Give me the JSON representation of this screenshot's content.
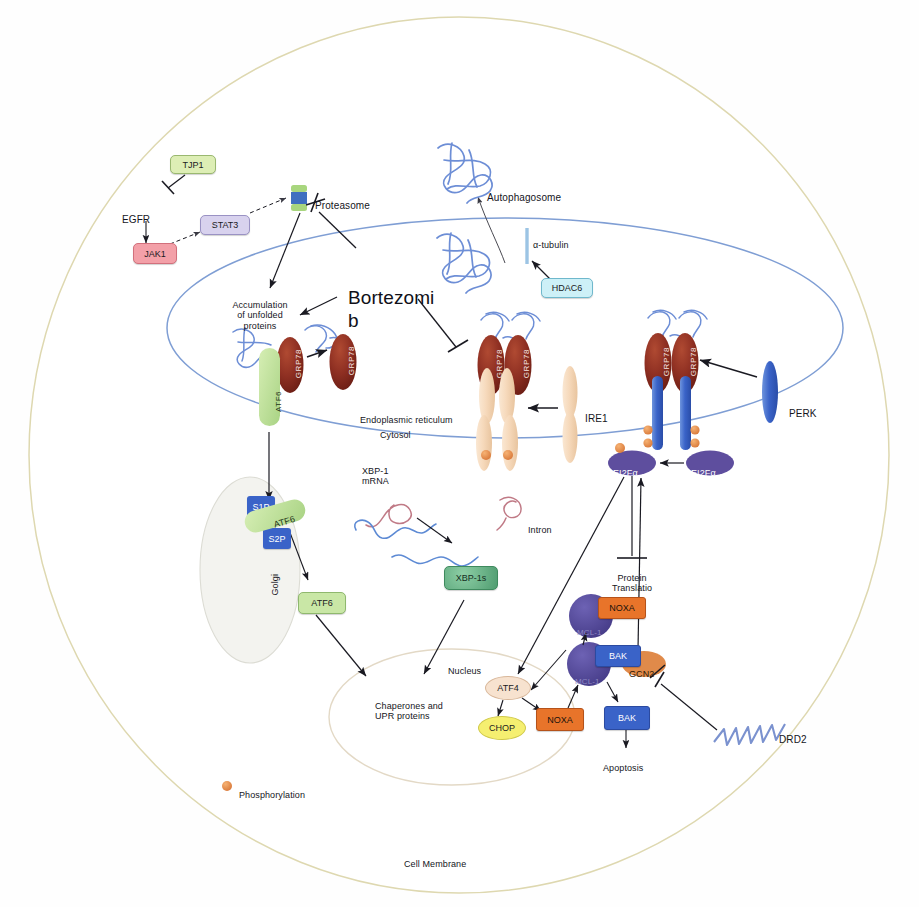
{
  "figure": {
    "compartments": {
      "cell_membrane": "Cell Membrane",
      "endoplasmic_reticulum": "Endoplasmic reticulum",
      "cytosol": "Cytosol",
      "golgi": "Golgi",
      "nucleus": "Nucleus"
    },
    "drug": {
      "label": "Bortezomi\nb",
      "full": "Bortezomib"
    },
    "legend": {
      "marker": "phosphorylation-dot",
      "label": "Phosphorylation",
      "color": "#e8944a"
    }
  },
  "nodes": {
    "tjp1": {
      "label": "TJP1",
      "fill": "#ddeeb5",
      "stroke": "#9ab870",
      "text": "#1a1a22"
    },
    "egfr": {
      "label": "EGFR",
      "fill": "none",
      "stroke": "none",
      "text": "#15151c"
    },
    "stat3": {
      "label": "STAT3",
      "fill": "#d8d2ee",
      "stroke": "#9a92c4",
      "text": "#1a1a22"
    },
    "jak1": {
      "label": "JAK1",
      "fill": "#f3a0a8",
      "stroke": "#d2707c",
      "text": "#1a1a22"
    },
    "proteasome": {
      "label": "Proteasome",
      "cap": "#b8dd86",
      "body": "#3f6fc0"
    },
    "accumulation": {
      "label": "Accumulation\nof unfolded\nproteins"
    },
    "autophagosome": {
      "label": "Autophagosome"
    },
    "tubulin": {
      "label": "α-tubulin",
      "color": "#9cc4e4"
    },
    "hdac6": {
      "label": "HDAC6",
      "fill": "#cdf0f7",
      "stroke": "#6fb8cc",
      "text": "#1a1a22"
    },
    "grp78": {
      "label": "GRP78",
      "fill": "#8e2f22"
    },
    "atf6_er": {
      "label": "ATF6",
      "fill": "#bfe39a"
    },
    "atf6_golgi": {
      "label": "ATF6",
      "fill": "#bfe39a"
    },
    "atf6_free": {
      "label": "ATF6",
      "fill": "#c9e7a6",
      "stroke": "#8fb86e"
    },
    "s1p": {
      "label": "S1P",
      "fill": "#3a63c8",
      "text": "#ffffff"
    },
    "s2p": {
      "label": "S2P",
      "fill": "#3a63c8",
      "text": "#ffffff"
    },
    "ire1": {
      "label": "IRE1",
      "fill": "#f6dcc0"
    },
    "perk": {
      "label": "PERK",
      "fill": "#3a63c8"
    },
    "xbp1_mrna": {
      "label": "XBP-1\nmRNA"
    },
    "intron": {
      "label": "Intron"
    },
    "xbp1s": {
      "label": "XBP-1s",
      "fill": "#6fbb8a",
      "stroke": "#3f8a5e",
      "text": "#17301f"
    },
    "chaperones": {
      "label": "Chaperones and\nUPR proteins"
    },
    "eif2a_p": {
      "label": "EI2Fα",
      "fill": "#5e4e9e",
      "text": "#ffffff"
    },
    "eif2a": {
      "label": "EI2Fα",
      "fill": "#5e4e9e",
      "text": "#ffffff"
    },
    "protein_translation": {
      "label": "Protein\nTranslatio\nn",
      "full": "Protein Translation"
    },
    "atf4": {
      "label": "ATF4",
      "fill": "#f7e2cf",
      "stroke": "#d8b79a",
      "text": "#1a1a22"
    },
    "chop": {
      "label": "CHOP",
      "fill": "#f5ef70",
      "stroke": "#cfc84a",
      "text": "#1a1a22"
    },
    "noxa_nuc": {
      "label": "NOXA",
      "fill": "#e8742a",
      "stroke": "#b5521a",
      "text": "#17120c"
    },
    "noxa_bound": {
      "label": "NOXA",
      "fill": "#e8742a",
      "stroke": "#b5521a",
      "text": "#17120c"
    },
    "mcl1_a": {
      "label": "MCL-1",
      "fill": "#544a9a"
    },
    "mcl1_b": {
      "label": "MCL-1",
      "fill": "#544a9a"
    },
    "bak_bound": {
      "label": "BAK",
      "fill": "#3a63c8",
      "text": "#ffffff"
    },
    "bak_free": {
      "label": "BAK",
      "fill": "#3a63c8",
      "text": "#ffffff"
    },
    "apoptosis": {
      "label": "Apoptosis"
    },
    "gcn2": {
      "label": "GCN2",
      "fill": "#e08a4a",
      "text": "#2a1606"
    },
    "drd2": {
      "label": "DRD2",
      "color": "#6f86c8"
    }
  },
  "edges": [
    {
      "from": "tjp1",
      "to": "egfr",
      "type": "inhibit"
    },
    {
      "from": "egfr",
      "to": "jak1",
      "type": "activate"
    },
    {
      "from": "jak1",
      "to": "stat3",
      "type": "activate-dashed"
    },
    {
      "from": "stat3",
      "to": "proteasome",
      "type": "activate-dashed"
    },
    {
      "from": "proteasome",
      "to": "accumulation",
      "type": "activate"
    },
    {
      "from": "bortezomib",
      "to": "proteasome",
      "type": "inhibit"
    },
    {
      "from": "bortezomib",
      "to": "accumulation",
      "type": "activate"
    },
    {
      "from": "bortezomib",
      "to": "ire1-grp78",
      "type": "inhibit"
    },
    {
      "from": "hdac6",
      "to": "tubulin",
      "type": "activate"
    },
    {
      "from": "unfolded-aggregate",
      "to": "autophagosome",
      "type": "activate"
    },
    {
      "from": "grp78",
      "to": "grp78-released",
      "type": "activate"
    },
    {
      "from": "atf6_er",
      "to": "golgi",
      "type": "activate"
    },
    {
      "from": "atf6_golgi",
      "to": "atf6_free",
      "type": "activate"
    },
    {
      "from": "atf6_free",
      "to": "chaperones",
      "type": "activate"
    },
    {
      "from": "ire1",
      "to": "ire1-dimer",
      "type": "activate"
    },
    {
      "from": "xbp1_mrna",
      "to": "xbp1-spliced",
      "type": "activate"
    },
    {
      "from": "xbp1s",
      "to": "chaperones",
      "type": "activate"
    },
    {
      "from": "perk",
      "to": "perk-dimer",
      "type": "activate"
    },
    {
      "from": "eif2a",
      "to": "eif2a_p",
      "type": "activate"
    },
    {
      "from": "eif2a_p",
      "to": "protein_translation",
      "type": "inhibit"
    },
    {
      "from": "eif2a_p",
      "to": "atf4",
      "type": "activate"
    },
    {
      "from": "atf4",
      "to": "chop",
      "type": "activate"
    },
    {
      "from": "atf4",
      "to": "noxa_nuc",
      "type": "activate"
    },
    {
      "from": "noxa_nuc",
      "to": "mcl1-bak",
      "type": "activate"
    },
    {
      "from": "mcl1-bak",
      "to": "mcl1-noxa",
      "type": "activate"
    },
    {
      "from": "mcl1-bak",
      "to": "bak_free",
      "type": "activate"
    },
    {
      "from": "bak_free",
      "to": "apoptosis",
      "type": "activate"
    },
    {
      "from": "gcn2",
      "to": "eif2a_p",
      "type": "activate"
    },
    {
      "from": "drd2",
      "to": "gcn2",
      "type": "inhibit"
    }
  ],
  "colors": {
    "cell_membrane": "#ded8b0",
    "er_membrane": "#7f9ed4",
    "nucleus_membrane": "#e3d9c6",
    "golgi_fill": "#f2f2ee",
    "arrow": "#1a1a22",
    "phospho": "#e8944a"
  }
}
